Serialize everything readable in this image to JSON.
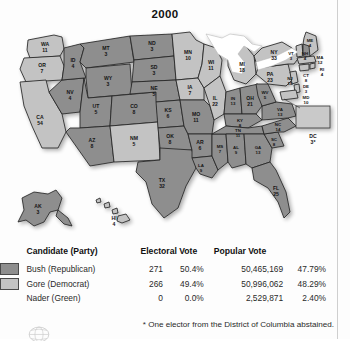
{
  "map": {
    "title": "2000",
    "dc_label": "DC",
    "dc_votes": "3*",
    "states": [
      {
        "code": "WA",
        "votes": "11",
        "party": "dem"
      },
      {
        "code": "OR",
        "votes": "7",
        "party": "dem"
      },
      {
        "code": "CA",
        "votes": "54",
        "party": "dem"
      },
      {
        "code": "NV",
        "votes": "4",
        "party": "rep"
      },
      {
        "code": "ID",
        "votes": "4",
        "party": "rep"
      },
      {
        "code": "MT",
        "votes": "3",
        "party": "rep"
      },
      {
        "code": "WY",
        "votes": "3",
        "party": "rep"
      },
      {
        "code": "UT",
        "votes": "5",
        "party": "rep"
      },
      {
        "code": "AZ",
        "votes": "8",
        "party": "rep"
      },
      {
        "code": "CO",
        "votes": "8",
        "party": "rep"
      },
      {
        "code": "NM",
        "votes": "5",
        "party": "dem"
      },
      {
        "code": "ND",
        "votes": "3",
        "party": "rep"
      },
      {
        "code": "SD",
        "votes": "3",
        "party": "rep"
      },
      {
        "code": "NE",
        "votes": "5",
        "party": "rep"
      },
      {
        "code": "KS",
        "votes": "6",
        "party": "rep"
      },
      {
        "code": "OK",
        "votes": "8",
        "party": "rep"
      },
      {
        "code": "TX",
        "votes": "32",
        "party": "rep"
      },
      {
        "code": "MN",
        "votes": "10",
        "party": "dem"
      },
      {
        "code": "IA",
        "votes": "7",
        "party": "dem"
      },
      {
        "code": "MO",
        "votes": "11",
        "party": "rep"
      },
      {
        "code": "AR",
        "votes": "6",
        "party": "rep"
      },
      {
        "code": "LA",
        "votes": "9",
        "party": "rep"
      },
      {
        "code": "WI",
        "votes": "11",
        "party": "dem"
      },
      {
        "code": "IL",
        "votes": "22",
        "party": "dem"
      },
      {
        "code": "MS",
        "votes": "7",
        "party": "rep"
      },
      {
        "code": "MI",
        "votes": "18",
        "party": "dem"
      },
      {
        "code": "IN",
        "votes": "13",
        "party": "rep"
      },
      {
        "code": "OH",
        "votes": "21",
        "party": "rep"
      },
      {
        "code": "KY",
        "votes": "8",
        "party": "rep"
      },
      {
        "code": "TN",
        "votes": "11",
        "party": "rep"
      },
      {
        "code": "AL",
        "votes": "9",
        "party": "rep"
      },
      {
        "code": "GA",
        "votes": "13",
        "party": "rep"
      },
      {
        "code": "FL",
        "votes": "25",
        "party": "rep"
      },
      {
        "code": "SC",
        "votes": "8",
        "party": "rep"
      },
      {
        "code": "NC",
        "votes": "14",
        "party": "rep"
      },
      {
        "code": "VA",
        "votes": "13",
        "party": "rep"
      },
      {
        "code": "WV",
        "votes": "5",
        "party": "rep"
      },
      {
        "code": "PA",
        "votes": "23",
        "party": "dem"
      },
      {
        "code": "NY",
        "votes": "33",
        "party": "dem"
      },
      {
        "code": "ME",
        "votes": "4",
        "party": "dem"
      },
      {
        "code": "VT",
        "votes": "3",
        "party": "dem"
      },
      {
        "code": "NH",
        "votes": "4",
        "party": "rep"
      },
      {
        "code": "MA",
        "votes": "12",
        "party": "dem"
      },
      {
        "code": "RI",
        "votes": "4",
        "party": "dem"
      },
      {
        "code": "CT",
        "votes": "8",
        "party": "dem"
      },
      {
        "code": "NJ",
        "votes": "15",
        "party": "dem"
      },
      {
        "code": "DE",
        "votes": "3",
        "party": "dem"
      },
      {
        "code": "MD",
        "votes": "10",
        "party": "dem"
      },
      {
        "code": "AK",
        "votes": "3",
        "party": "rep"
      },
      {
        "code": "HI",
        "votes": "4",
        "party": "dem"
      }
    ]
  },
  "legend": {
    "headers": {
      "candidate": "Candidate (Party)",
      "electoral": "Electoral Vote",
      "popular": "Popular Vote"
    },
    "rows": [
      {
        "swatch": "rep",
        "candidate": "Bush (Republican)",
        "electoral_votes": "271",
        "electoral_pct": "50.4%",
        "popular_votes": "50,465,169",
        "popular_pct": "47.79%"
      },
      {
        "swatch": "dem",
        "candidate": "Gore (Democrat)",
        "electoral_votes": "266",
        "electoral_pct": "49.4%",
        "popular_votes": "50,996,062",
        "popular_pct": "48.29%"
      },
      {
        "swatch": "none",
        "candidate": "Nader (Green)",
        "electoral_votes": "0",
        "electoral_pct": "0.0%",
        "popular_votes": "2,529,871",
        "popular_pct": "2.40%"
      }
    ],
    "footnote": "* One elector from the District of Columbia abstained."
  },
  "colors": {
    "republican": "#8e8e8e",
    "democrat": "#c3c3c3",
    "outline": "#262626"
  },
  "chart_data": {
    "type": "map",
    "title": "2000",
    "legend_position": "below",
    "series": [
      {
        "name": "Bush (Republican)",
        "electoral": 271,
        "electoral_pct": 50.4,
        "popular": 50465169,
        "popular_pct": 47.79,
        "color": "#8e8e8e"
      },
      {
        "name": "Gore (Democrat)",
        "electoral": 266,
        "electoral_pct": 49.4,
        "popular": 50996062,
        "popular_pct": 48.29,
        "color": "#c3c3c3"
      },
      {
        "name": "Nader (Green)",
        "electoral": 0,
        "electoral_pct": 0.0,
        "popular": 2529871,
        "popular_pct": 2.4,
        "color": "none"
      }
    ],
    "categories": [
      "WA",
      "OR",
      "CA",
      "NV",
      "ID",
      "MT",
      "WY",
      "UT",
      "AZ",
      "CO",
      "NM",
      "ND",
      "SD",
      "NE",
      "KS",
      "OK",
      "TX",
      "MN",
      "IA",
      "MO",
      "AR",
      "LA",
      "WI",
      "IL",
      "MS",
      "MI",
      "IN",
      "OH",
      "KY",
      "TN",
      "AL",
      "GA",
      "FL",
      "SC",
      "NC",
      "VA",
      "WV",
      "PA",
      "NY",
      "ME",
      "VT",
      "NH",
      "MA",
      "RI",
      "CT",
      "NJ",
      "DE",
      "MD",
      "AK",
      "HI",
      "DC"
    ],
    "values": [
      11,
      7,
      54,
      4,
      4,
      3,
      3,
      5,
      8,
      8,
      5,
      3,
      3,
      5,
      6,
      8,
      32,
      10,
      7,
      11,
      6,
      9,
      11,
      22,
      7,
      18,
      13,
      21,
      8,
      11,
      9,
      13,
      25,
      8,
      14,
      13,
      5,
      23,
      33,
      4,
      3,
      4,
      12,
      4,
      8,
      15,
      3,
      10,
      3,
      4,
      3
    ],
    "winner_by_state": [
      "dem",
      "dem",
      "dem",
      "rep",
      "rep",
      "rep",
      "rep",
      "rep",
      "rep",
      "rep",
      "dem",
      "rep",
      "rep",
      "rep",
      "rep",
      "rep",
      "rep",
      "dem",
      "dem",
      "rep",
      "rep",
      "rep",
      "dem",
      "dem",
      "rep",
      "dem",
      "rep",
      "rep",
      "rep",
      "rep",
      "rep",
      "rep",
      "rep",
      "rep",
      "rep",
      "rep",
      "rep",
      "dem",
      "dem",
      "dem",
      "dem",
      "rep",
      "dem",
      "dem",
      "dem",
      "dem",
      "dem",
      "dem",
      "rep",
      "dem",
      "dem"
    ]
  }
}
